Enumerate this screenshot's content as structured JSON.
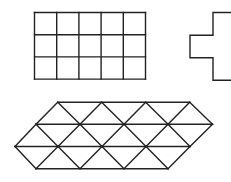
{
  "canvas": {
    "width": 231,
    "height": 182,
    "background": "#ffffff",
    "line_color": "#222222"
  },
  "figures": {
    "square_grid": {
      "description": "rectangle divided into a 3x5 grid of squares",
      "rows": 3,
      "cols": 5,
      "x": 34.5,
      "y": 12.5,
      "cell": 22.2
    },
    "cross": {
      "description": "plus-shaped outline made of five squares, partially cut off at the right edge",
      "cell": 22.5,
      "arm_left_x": 190,
      "arm_top_y": 35.3,
      "stem_left_x": 213,
      "stem_top_y": 12.5
    },
    "triangle_grid": {
      "description": "parallelogram-like shape tiled with equilateral-style triangles in 3 rows",
      "rows": 3,
      "row_y": [
        102.3,
        124.3,
        146.5,
        168.8
      ],
      "row_x": [
        [
          57.7,
          101.7,
          145.7,
          189.7
        ],
        [
          36,
          80,
          124,
          168,
          212.5
        ],
        [
          15,
          58,
          102,
          146,
          190
        ],
        [
          36,
          80,
          124,
          168
        ]
      ]
    }
  }
}
